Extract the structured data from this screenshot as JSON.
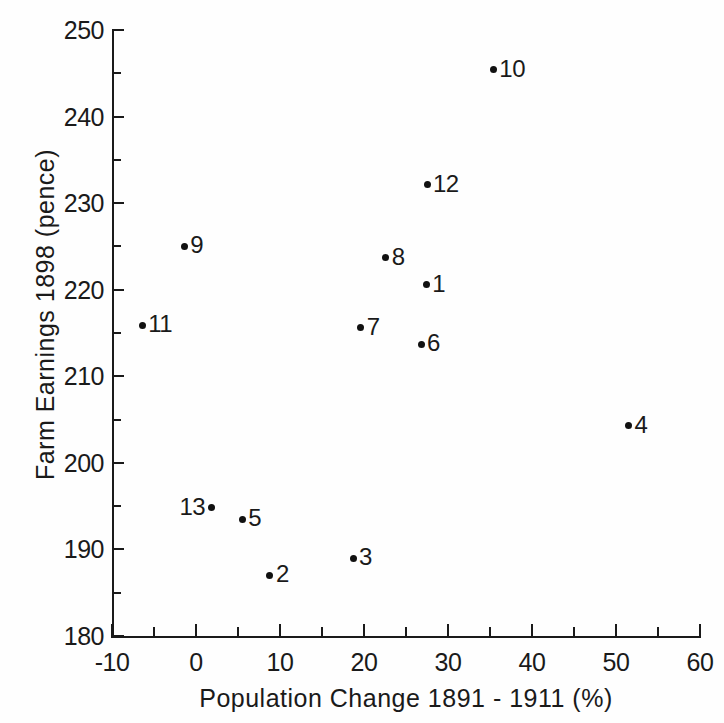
{
  "chart_data": {
    "type": "scatter",
    "title": "",
    "xlabel": "Population Change  1891 - 1911 (%)",
    "ylabel": "Farm Earnings 1898  (pence)",
    "xlim": [
      -10,
      60
    ],
    "ylim": [
      180,
      250
    ],
    "x_major_ticks": [
      -10,
      0,
      10,
      20,
      30,
      40,
      50,
      60
    ],
    "x_minor_ticks": [
      -5,
      5,
      15,
      25,
      35,
      45,
      55
    ],
    "y_major_ticks": [
      180,
      190,
      200,
      210,
      220,
      230,
      240,
      250
    ],
    "y_minor_ticks": [
      185,
      195,
      205,
      215,
      225,
      235,
      245
    ],
    "x_tick_labels": [
      "-10",
      "0",
      "10",
      "20",
      "30",
      "40",
      "50",
      "60"
    ],
    "y_tick_labels": [
      "180",
      "190",
      "200",
      "210",
      "220",
      "230",
      "240",
      "250"
    ],
    "grid": false,
    "legend": "none",
    "marker_color": "#111111",
    "axis_color": "#1a1a1a",
    "points": [
      {
        "label": "1",
        "x": 27.4,
        "y": 220.6,
        "label_side": "right"
      },
      {
        "label": "2",
        "x": 8.8,
        "y": 187.0,
        "label_side": "right"
      },
      {
        "label": "3",
        "x": 18.7,
        "y": 189.0,
        "label_side": "right"
      },
      {
        "label": "4",
        "x": 51.5,
        "y": 204.3,
        "label_side": "right"
      },
      {
        "label": "5",
        "x": 5.5,
        "y": 193.5,
        "label_side": "right"
      },
      {
        "label": "6",
        "x": 26.8,
        "y": 213.7,
        "label_side": "right"
      },
      {
        "label": "7",
        "x": 19.6,
        "y": 215.6,
        "label_side": "right"
      },
      {
        "label": "8",
        "x": 22.6,
        "y": 223.7,
        "label_side": "right"
      },
      {
        "label": "9",
        "x": -1.4,
        "y": 225.0,
        "label_side": "right"
      },
      {
        "label": "10",
        "x": 35.4,
        "y": 245.4,
        "label_side": "right"
      },
      {
        "label": "11",
        "x": -6.4,
        "y": 215.9,
        "label_side": "right"
      },
      {
        "label": "12",
        "x": 27.5,
        "y": 232.1,
        "label_side": "right"
      },
      {
        "label": "13",
        "x": 1.8,
        "y": 194.8,
        "label_side": "left"
      }
    ]
  }
}
